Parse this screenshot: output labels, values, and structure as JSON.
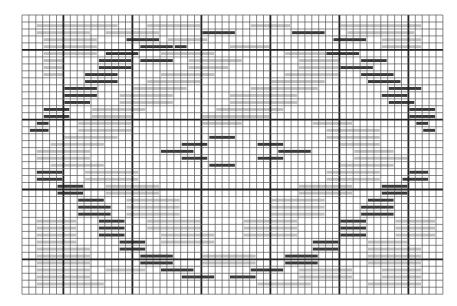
{
  "chart_data": {
    "type": "grid-pattern",
    "title": "",
    "grid": {
      "origin_x": 22,
      "origin_y": 15,
      "cols": 61,
      "rows": 40,
      "cell_w": 6.9,
      "cell_h": 6.98,
      "major_every": 10,
      "major_col_offset": 6,
      "major_row_offset": 5,
      "thin_color": "#555555",
      "major_color": "#222222"
    },
    "colors": {
      "dark": "#3a3a3a",
      "light": "#bdbdbd",
      "background": "#ffffff"
    },
    "dark_bars": [
      [
        2,
        26,
        5
      ],
      [
        2,
        39,
        5
      ],
      [
        3,
        15,
        5
      ],
      [
        3,
        45,
        5
      ],
      [
        4,
        17,
        5
      ],
      [
        4,
        22,
        2
      ],
      [
        5,
        12,
        5
      ],
      [
        5,
        44,
        5
      ],
      [
        6,
        17,
        5
      ],
      [
        6,
        11,
        5
      ],
      [
        6,
        49,
        4
      ],
      [
        7,
        11,
        5
      ],
      [
        7,
        46,
        5
      ],
      [
        8,
        9,
        5
      ],
      [
        8,
        49,
        5
      ],
      [
        9,
        9,
        5
      ],
      [
        9,
        50,
        5
      ],
      [
        10,
        6,
        5
      ],
      [
        10,
        53,
        5
      ],
      [
        11,
        6,
        5
      ],
      [
        11,
        52,
        4
      ],
      [
        12,
        6,
        4
      ],
      [
        12,
        53,
        4
      ],
      [
        13,
        3,
        4
      ],
      [
        13,
        56,
        4
      ],
      [
        14,
        3,
        4
      ],
      [
        14,
        56,
        4
      ],
      [
        15,
        2,
        2
      ],
      [
        15,
        57,
        2
      ],
      [
        16,
        1,
        3
      ],
      [
        16,
        58,
        2
      ],
      [
        17,
        27,
        4
      ],
      [
        18,
        23,
        4
      ],
      [
        18,
        34,
        4
      ],
      [
        19,
        20,
        5
      ],
      [
        19,
        37,
        5
      ],
      [
        20,
        23,
        4
      ],
      [
        20,
        34,
        4
      ],
      [
        21,
        27,
        4
      ],
      [
        22,
        2,
        4
      ],
      [
        22,
        56,
        3
      ],
      [
        23,
        2,
        4
      ],
      [
        23,
        55,
        4
      ],
      [
        24,
        5,
        4
      ],
      [
        24,
        52,
        4
      ],
      [
        25,
        5,
        4
      ],
      [
        25,
        52,
        4
      ],
      [
        26,
        8,
        4
      ],
      [
        26,
        50,
        4
      ],
      [
        27,
        8,
        5
      ],
      [
        27,
        49,
        5
      ],
      [
        28,
        8,
        5
      ],
      [
        28,
        49,
        5
      ],
      [
        29,
        11,
        4
      ],
      [
        29,
        46,
        4
      ],
      [
        30,
        11,
        4
      ],
      [
        30,
        46,
        4
      ],
      [
        31,
        11,
        4
      ],
      [
        31,
        46,
        4
      ],
      [
        32,
        14,
        4
      ],
      [
        32,
        42,
        4
      ],
      [
        33,
        14,
        4
      ],
      [
        33,
        42,
        4
      ],
      [
        34,
        17,
        5
      ],
      [
        34,
        38,
        5
      ],
      [
        35,
        17,
        5
      ],
      [
        35,
        38,
        5
      ],
      [
        36,
        20,
        5
      ],
      [
        36,
        33,
        5
      ],
      [
        37,
        23,
        5
      ],
      [
        37,
        30,
        4
      ]
    ],
    "light_bars": [
      [
        1,
        2,
        12
      ],
      [
        1,
        18,
        8
      ],
      [
        1,
        33,
        6
      ],
      [
        1,
        46,
        12
      ],
      [
        2,
        2,
        8
      ],
      [
        2,
        12,
        8
      ],
      [
        2,
        47,
        10
      ],
      [
        3,
        3,
        8
      ],
      [
        3,
        21,
        6
      ],
      [
        3,
        52,
        6
      ],
      [
        4,
        3,
        8
      ],
      [
        4,
        30,
        6
      ],
      [
        4,
        52,
        6
      ],
      [
        5,
        3,
        8
      ],
      [
        5,
        20,
        8
      ],
      [
        5,
        38,
        8
      ],
      [
        6,
        3,
        3
      ],
      [
        6,
        24,
        8
      ],
      [
        6,
        40,
        6
      ],
      [
        7,
        3,
        3
      ],
      [
        7,
        24,
        6
      ],
      [
        7,
        40,
        6
      ],
      [
        8,
        3,
        3
      ],
      [
        8,
        20,
        8
      ],
      [
        8,
        38,
        8
      ],
      [
        9,
        18,
        8
      ],
      [
        9,
        36,
        8
      ],
      [
        10,
        16,
        8
      ],
      [
        10,
        33,
        10
      ],
      [
        11,
        14,
        8
      ],
      [
        11,
        30,
        10
      ],
      [
        12,
        14,
        8
      ],
      [
        12,
        30,
        10
      ],
      [
        13,
        10,
        8
      ],
      [
        13,
        28,
        10
      ],
      [
        14,
        10,
        6
      ],
      [
        14,
        26,
        10
      ],
      [
        15,
        8,
        8
      ],
      [
        15,
        26,
        6
      ],
      [
        15,
        42,
        6
      ],
      [
        16,
        8,
        8
      ],
      [
        16,
        44,
        8
      ],
      [
        17,
        6,
        8
      ],
      [
        17,
        44,
        8
      ],
      [
        18,
        4,
        8
      ],
      [
        18,
        46,
        6
      ],
      [
        19,
        2,
        8
      ],
      [
        19,
        48,
        6
      ],
      [
        20,
        2,
        8
      ],
      [
        20,
        48,
        8
      ],
      [
        21,
        4,
        8
      ],
      [
        21,
        46,
        8
      ],
      [
        22,
        9,
        8
      ],
      [
        22,
        44,
        8
      ],
      [
        23,
        9,
        8
      ],
      [
        23,
        44,
        8
      ],
      [
        24,
        12,
        8
      ],
      [
        24,
        40,
        8
      ],
      [
        25,
        12,
        8
      ],
      [
        25,
        40,
        8
      ],
      [
        26,
        15,
        8
      ],
      [
        26,
        36,
        8
      ],
      [
        27,
        15,
        8
      ],
      [
        27,
        36,
        8
      ],
      [
        28,
        15,
        8
      ],
      [
        28,
        36,
        8
      ],
      [
        29,
        2,
        6
      ],
      [
        29,
        18,
        8
      ],
      [
        29,
        32,
        8
      ],
      [
        29,
        54,
        6
      ],
      [
        30,
        2,
        6
      ],
      [
        30,
        18,
        8
      ],
      [
        30,
        32,
        8
      ],
      [
        30,
        54,
        6
      ],
      [
        31,
        2,
        6
      ],
      [
        31,
        20,
        8
      ],
      [
        31,
        32,
        8
      ],
      [
        31,
        54,
        6
      ],
      [
        32,
        2,
        6
      ],
      [
        32,
        20,
        8
      ],
      [
        32,
        50,
        6
      ],
      [
        33,
        2,
        8
      ],
      [
        33,
        50,
        8
      ],
      [
        34,
        2,
        8
      ],
      [
        34,
        26,
        8
      ],
      [
        34,
        50,
        8
      ],
      [
        35,
        2,
        8
      ],
      [
        35,
        26,
        8
      ],
      [
        35,
        50,
        8
      ],
      [
        36,
        2,
        8
      ],
      [
        36,
        12,
        6
      ],
      [
        36,
        40,
        8
      ],
      [
        36,
        52,
        6
      ],
      [
        37,
        2,
        8
      ],
      [
        37,
        40,
        8
      ],
      [
        37,
        52,
        6
      ],
      [
        38,
        2,
        10
      ],
      [
        38,
        34,
        8
      ],
      [
        38,
        50,
        8
      ]
    ]
  }
}
